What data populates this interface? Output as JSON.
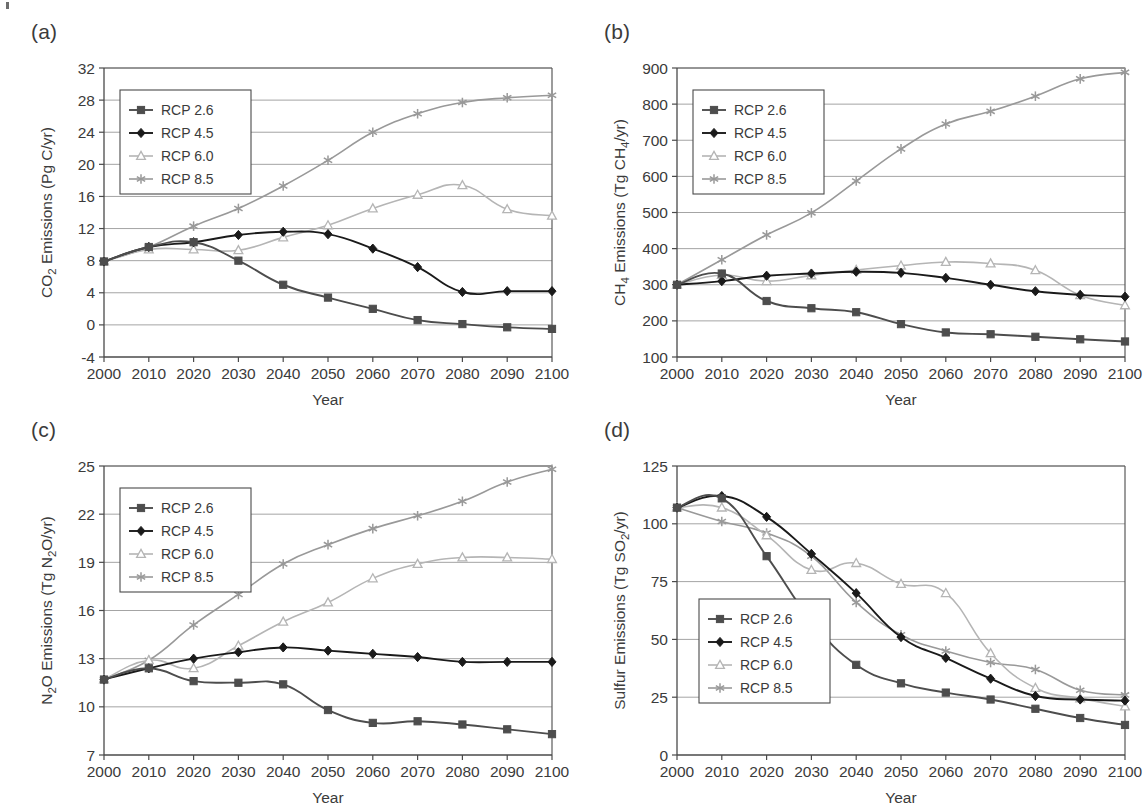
{
  "figure": {
    "panel_letters": [
      "(a)",
      "(b)",
      "(c)",
      "(d)"
    ],
    "shared_xlabel": "Year",
    "legend_entries": [
      "RCP 2.6",
      "RCP 4.5",
      "RCP 6.0",
      "RCP 8.5"
    ],
    "series_colors": [
      "#4d4d4d",
      "#1a1a1a",
      "#b5b5b5",
      "#999999"
    ],
    "series_markers": [
      "square",
      "diamond",
      "open-triangle",
      "asterisk"
    ]
  },
  "chart_data": [
    {
      "type": "line",
      "panel": "(a)",
      "title": "",
      "xlabel": "Year",
      "ylabel": "CO2 Emissions (Pg C/yr)",
      "ylabel_parts": [
        "CO",
        "2",
        " Emissions (Pg C/yr)"
      ],
      "x": [
        2000,
        2010,
        2020,
        2030,
        2040,
        2050,
        2060,
        2070,
        2080,
        2090,
        2100
      ],
      "xticks": [
        "2000",
        "2010",
        "2020",
        "2030",
        "2040",
        "2050",
        "2060",
        "2070",
        "2080",
        "2090",
        "2100"
      ],
      "yticks": [
        "-4",
        "0",
        "4",
        "8",
        "12",
        "16",
        "20",
        "24",
        "28",
        "32"
      ],
      "ytick_values": [
        -4,
        0,
        4,
        8,
        12,
        16,
        20,
        24,
        28,
        32
      ],
      "xlim": [
        2000,
        2100
      ],
      "ylim": [
        -4,
        32
      ],
      "grid": true,
      "legend_position": "upper-left",
      "series": [
        {
          "name": "RCP 2.6",
          "values": [
            7.9,
            9.7,
            10.3,
            8.0,
            5.0,
            3.4,
            2.0,
            0.6,
            0.1,
            -0.3,
            -0.5
          ]
        },
        {
          "name": "RCP 4.5",
          "values": [
            7.9,
            9.7,
            10.3,
            11.2,
            11.6,
            11.3,
            9.5,
            7.2,
            4.1,
            4.2,
            4.2
          ]
        },
        {
          "name": "RCP 6.0",
          "values": [
            7.9,
            9.4,
            9.4,
            9.3,
            10.9,
            12.4,
            14.5,
            16.2,
            17.4,
            14.4,
            13.6
          ]
        },
        {
          "name": "RCP 8.5",
          "values": [
            7.9,
            9.7,
            12.3,
            14.5,
            17.3,
            20.5,
            24.0,
            26.3,
            27.7,
            28.3,
            28.6
          ]
        }
      ]
    },
    {
      "type": "line",
      "panel": "(b)",
      "title": "",
      "xlabel": "Year",
      "ylabel": "CH4 Emissions (Tg CH4/yr)",
      "ylabel_parts": [
        "CH",
        "4",
        " Emissions (Tg CH",
        "4",
        "/yr)"
      ],
      "x": [
        2000,
        2010,
        2020,
        2030,
        2040,
        2050,
        2060,
        2070,
        2080,
        2090,
        2100
      ],
      "xticks": [
        "2000",
        "2010",
        "2020",
        "2030",
        "2040",
        "2050",
        "2060",
        "2070",
        "2080",
        "2090",
        "2100"
      ],
      "yticks": [
        "100",
        "200",
        "300",
        "400",
        "500",
        "600",
        "700",
        "800",
        "900"
      ],
      "ytick_values": [
        100,
        200,
        300,
        400,
        500,
        600,
        700,
        800,
        900
      ],
      "xlim": [
        2000,
        2100
      ],
      "ylim": [
        100,
        900
      ],
      "grid": true,
      "legend_position": "upper-left",
      "series": [
        {
          "name": "RCP 2.6",
          "values": [
            300,
            331,
            255,
            235,
            224,
            191,
            168,
            163,
            156,
            149,
            143
          ]
        },
        {
          "name": "RCP 4.5",
          "values": [
            300,
            310,
            325,
            331,
            336,
            333,
            319,
            300,
            282,
            272,
            267
          ]
        },
        {
          "name": "RCP 6.0",
          "values": [
            300,
            327,
            310,
            326,
            341,
            353,
            363,
            359,
            340,
            271,
            243
          ]
        },
        {
          "name": "RCP 8.5",
          "values": [
            300,
            369,
            438,
            499,
            587,
            676,
            745,
            780,
            822,
            870,
            888
          ]
        }
      ]
    },
    {
      "type": "line",
      "panel": "(c)",
      "title": "",
      "xlabel": "Year",
      "ylabel": "N2O Emissions (Tg N2O/yr)",
      "ylabel_parts": [
        "N",
        "2",
        "O Emissions (Tg N",
        "2",
        "O/yr)"
      ],
      "x": [
        2000,
        2010,
        2020,
        2030,
        2040,
        2050,
        2060,
        2070,
        2080,
        2090,
        2100
      ],
      "xticks": [
        "2000",
        "2010",
        "2020",
        "2030",
        "2040",
        "2050",
        "2060",
        "2070",
        "2080",
        "2090",
        "2100"
      ],
      "yticks": [
        "7",
        "10",
        "13",
        "16",
        "19",
        "22",
        "25"
      ],
      "ytick_values": [
        7,
        10,
        13,
        16,
        19,
        22,
        25
      ],
      "xlim": [
        2000,
        2100
      ],
      "ylim": [
        7,
        25
      ],
      "grid": true,
      "legend_position": "upper-left",
      "series": [
        {
          "name": "RCP 2.6",
          "values": [
            11.7,
            12.4,
            11.6,
            11.5,
            11.4,
            9.8,
            9.0,
            9.1,
            8.9,
            8.6,
            8.3
          ]
        },
        {
          "name": "RCP 4.5",
          "values": [
            11.7,
            12.4,
            13.0,
            13.4,
            13.7,
            13.5,
            13.3,
            13.1,
            12.8,
            12.8,
            12.8
          ]
        },
        {
          "name": "RCP 6.0",
          "values": [
            11.7,
            12.9,
            12.4,
            13.8,
            15.3,
            16.5,
            18.0,
            18.9,
            19.3,
            19.3,
            19.2
          ]
        },
        {
          "name": "RCP 8.5",
          "values": [
            11.7,
            12.9,
            15.1,
            17.0,
            18.9,
            20.1,
            21.1,
            21.9,
            22.8,
            24.0,
            24.8
          ]
        }
      ]
    },
    {
      "type": "line",
      "panel": "(d)",
      "title": "",
      "xlabel": "Year",
      "ylabel": "Sulfur Emissions (Tg SO2/yr)",
      "ylabel_parts": [
        "Sulfur Emissions (Tg SO",
        "2",
        "/yr)"
      ],
      "x": [
        2000,
        2010,
        2020,
        2030,
        2040,
        2050,
        2060,
        2070,
        2080,
        2090,
        2100
      ],
      "xticks": [
        "2000",
        "2010",
        "2020",
        "2030",
        "2040",
        "2050",
        "2060",
        "2070",
        "2080",
        "2090",
        "2100"
      ],
      "yticks": [
        "0",
        "25",
        "50",
        "75",
        "100",
        "125"
      ],
      "ytick_values": [
        0,
        25,
        50,
        75,
        100,
        125
      ],
      "xlim": [
        2000,
        2100
      ],
      "ylim": [
        0,
        125
      ],
      "grid": true,
      "legend_position": "lower-left",
      "series": [
        {
          "name": "RCP 2.6",
          "values": [
            107,
            111,
            86,
            58,
            39,
            31,
            27,
            24,
            20,
            16,
            13
          ]
        },
        {
          "name": "RCP 4.5",
          "values": [
            107,
            112,
            103,
            87,
            70,
            51,
            42,
            33,
            25.5,
            24,
            23.5
          ]
        },
        {
          "name": "RCP 6.0",
          "values": [
            107,
            107,
            95,
            80,
            83,
            74,
            70,
            44,
            29,
            24.5,
            21
          ]
        },
        {
          "name": "RCP 8.5",
          "values": [
            107,
            101,
            96,
            86,
            66,
            52,
            45,
            40,
            37,
            28,
            26
          ]
        }
      ]
    }
  ]
}
